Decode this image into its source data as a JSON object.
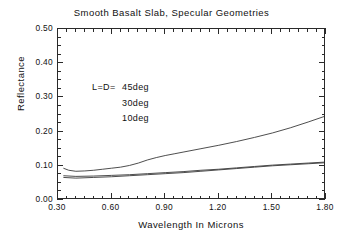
{
  "chart_data": {
    "type": "line",
    "title": "Smooth Basalt Slab, Specular Geometries",
    "xlabel": "Wavelength In Microns",
    "ylabel": "Reflectance",
    "xlim": [
      0.3,
      1.8
    ],
    "ylim": [
      0.0,
      0.5
    ],
    "xticks": [
      "0.30",
      "0.60",
      "0.90",
      "1.20",
      "1.50",
      "1.80"
    ],
    "xtick_values": [
      0.3,
      0.6,
      0.9,
      1.2,
      1.5,
      1.8
    ],
    "yticks": [
      "0.00",
      "0.10",
      "0.20",
      "0.30",
      "0.40",
      "0.50"
    ],
    "ytick_values": [
      0.0,
      0.1,
      0.2,
      0.3,
      0.4,
      0.5
    ],
    "x_minor_step": 0.05,
    "y_minor_step": 0.025,
    "grid": false,
    "legend_position": "upper-left-inside",
    "legend_prefix": "L=D=",
    "series": [
      {
        "name": "45deg",
        "label": "45deg",
        "color": "#3a3a3a",
        "x": [
          0.33,
          0.36,
          0.4,
          0.45,
          0.5,
          0.55,
          0.6,
          0.65,
          0.7,
          0.75,
          0.8,
          0.85,
          0.9,
          0.95,
          1.0,
          1.1,
          1.2,
          1.3,
          1.4,
          1.5,
          1.6,
          1.7,
          1.8
        ],
        "y": [
          0.093,
          0.087,
          0.084,
          0.085,
          0.087,
          0.09,
          0.093,
          0.096,
          0.101,
          0.108,
          0.117,
          0.124,
          0.13,
          0.135,
          0.14,
          0.15,
          0.16,
          0.171,
          0.183,
          0.196,
          0.211,
          0.228,
          0.246
        ]
      },
      {
        "name": "30deg",
        "label": "30deg",
        "color": "#3a3a3a",
        "x": [
          0.33,
          0.4,
          0.5,
          0.6,
          0.7,
          0.8,
          0.9,
          1.0,
          1.1,
          1.2,
          1.3,
          1.4,
          1.5,
          1.6,
          1.7,
          1.8
        ],
        "y": [
          0.071,
          0.069,
          0.07,
          0.072,
          0.074,
          0.077,
          0.08,
          0.083,
          0.087,
          0.09,
          0.094,
          0.098,
          0.102,
          0.105,
          0.108,
          0.111
        ]
      },
      {
        "name": "10deg",
        "label": "10deg",
        "color": "#3a3a3a",
        "x": [
          0.33,
          0.4,
          0.5,
          0.6,
          0.7,
          0.8,
          0.9,
          1.0,
          1.1,
          1.2,
          1.3,
          1.4,
          1.5,
          1.6,
          1.7,
          1.8
        ],
        "y": [
          0.066,
          0.064,
          0.066,
          0.068,
          0.071,
          0.074,
          0.077,
          0.08,
          0.084,
          0.088,
          0.092,
          0.096,
          0.1,
          0.103,
          0.106,
          0.109
        ]
      }
    ]
  }
}
